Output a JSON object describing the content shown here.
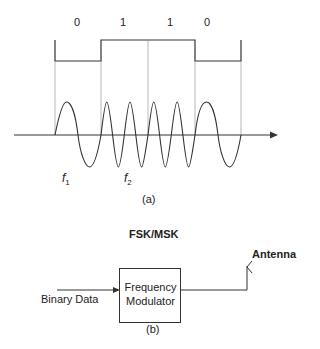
{
  "part_a": {
    "bits": [
      "0",
      "1",
      "1",
      "0"
    ],
    "freq_labels": [
      {
        "symbol": "f",
        "subscript": "1"
      },
      {
        "symbol": "f",
        "subscript": "2"
      }
    ],
    "caption": "(a)"
  },
  "part_b": {
    "title": "FSK/MSK",
    "input_label": "Binary Data",
    "block_line1": "Frequency",
    "block_line2": "Modulator",
    "output_label": "Antenna",
    "caption": "(b)"
  },
  "colors": {
    "line": "#333333",
    "guide": "#888888",
    "background": "#ffffff"
  }
}
